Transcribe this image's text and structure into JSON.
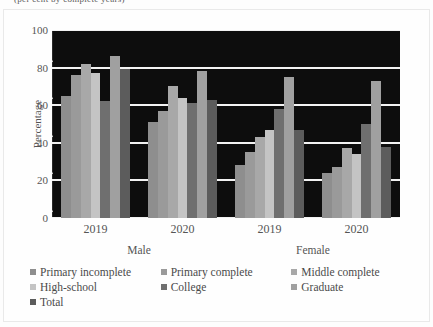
{
  "top_clipped_text": "(per cent by complete years)",
  "axis": {
    "y_title": "Percentage",
    "y_ticks": [
      0,
      20,
      40,
      60,
      80,
      100
    ],
    "y_min": 0,
    "y_max": 100
  },
  "x_years": [
    "2019",
    "2020",
    "2019",
    "2020"
  ],
  "x_genders": [
    "Male",
    "Female"
  ],
  "legend": [
    {
      "label": "Primary incomplete",
      "color": "#8e8e8e"
    },
    {
      "label": "Primary complete",
      "color": "#9a9a9a"
    },
    {
      "label": "Middle complete",
      "color": "#a8a8a8"
    },
    {
      "label": "High-school",
      "color": "#c4c4c4"
    },
    {
      "label": "College",
      "color": "#6f6f6f"
    },
    {
      "label": "Graduate",
      "color": "#a0a0a0"
    },
    {
      "label": "Total",
      "color": "#5c5c5c"
    }
  ],
  "chart_data": {
    "type": "bar",
    "title": "",
    "xlabel": "",
    "ylabel": "Percentage",
    "ylim": [
      0,
      100
    ],
    "grid": true,
    "legend_position": "bottom",
    "categories": [
      "Male 2019",
      "Male 2020",
      "Female 2019",
      "Female 2020"
    ],
    "series": [
      {
        "name": "Primary incomplete",
        "color": "#8e8e8e",
        "values": [
          65,
          51,
          28,
          24
        ]
      },
      {
        "name": "Primary complete",
        "color": "#9a9a9a",
        "values": [
          76,
          57,
          35,
          27
        ]
      },
      {
        "name": "Middle complete",
        "color": "#a8a8a8",
        "values": [
          82,
          70,
          43,
          37
        ]
      },
      {
        "name": "High-school",
        "color": "#c4c4c4",
        "values": [
          77,
          64,
          47,
          34
        ]
      },
      {
        "name": "College",
        "color": "#6f6f6f",
        "values": [
          62,
          61,
          58,
          50
        ]
      },
      {
        "name": "Graduate",
        "color": "#a0a0a0",
        "values": [
          86,
          78,
          75,
          73
        ]
      },
      {
        "name": "Total",
        "color": "#5c5c5c",
        "values": [
          79,
          63,
          47,
          38
        ]
      }
    ]
  }
}
